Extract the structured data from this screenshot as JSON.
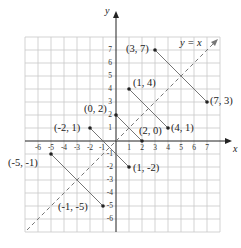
{
  "diagram": {
    "axes": {
      "x_label": "x",
      "y_label": "y"
    },
    "x_ticks": [
      "-6",
      "-5",
      "-4",
      "-3",
      "-2",
      "-1",
      "1",
      "2",
      "3",
      "4",
      "5",
      "6",
      "7"
    ],
    "y_ticks": [
      "7",
      "6",
      "5",
      "4",
      "3",
      "2",
      "1",
      "-1",
      "-2",
      "-3",
      "-4",
      "-5",
      "-6"
    ],
    "line_label": "y = x",
    "points": [
      {
        "label": "(3, 7)"
      },
      {
        "label": "(7, 3)"
      },
      {
        "label": "(1, 4)"
      },
      {
        "label": "(4, 1)"
      },
      {
        "label": "(0, 2)"
      },
      {
        "label": "(2, 0)"
      },
      {
        "label": "(-2, 1)"
      },
      {
        "label": "(1, -2)"
      },
      {
        "label": "(-5, -1)"
      },
      {
        "label": "(-1, -5)"
      }
    ],
    "colors": {
      "grid": "#c8c8c8",
      "axis": "#222222",
      "dashed": "#777777"
    }
  }
}
